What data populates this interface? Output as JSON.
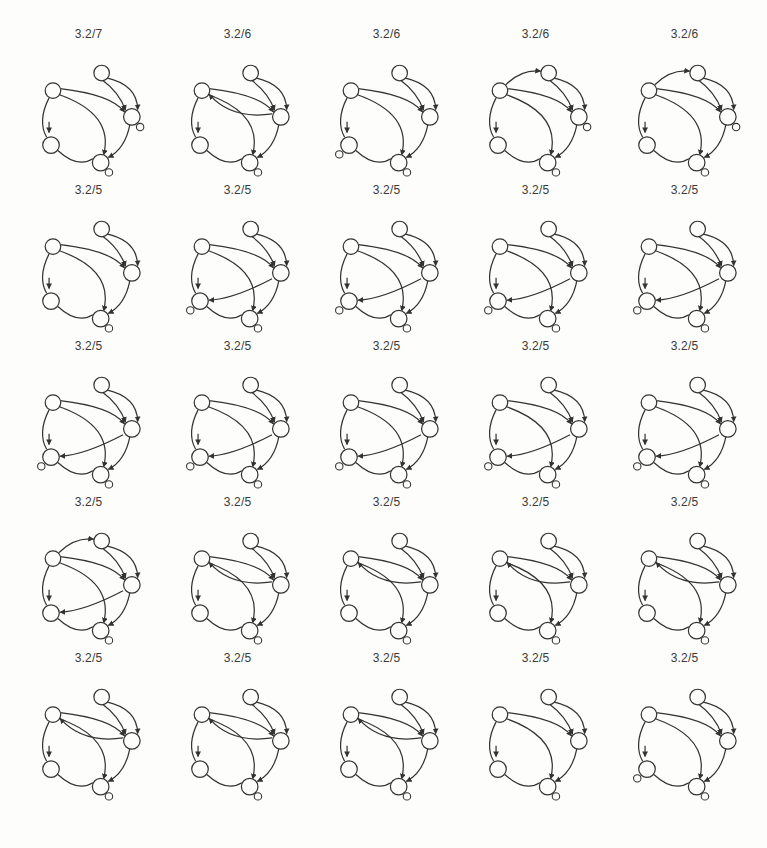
{
  "figure": {
    "background": "#fdfdfc",
    "stroke_color": "#333333",
    "node_fill": "#fdfdfc",
    "label_color": "#3a3a3a",
    "grid": {
      "rows": 5,
      "cols": 5
    }
  },
  "diagram_library": {
    "nodes": {
      "A": {
        "x": 40,
        "y": 46,
        "r": 8
      },
      "B": {
        "x": 90,
        "y": 28,
        "r": 8
      },
      "C": {
        "x": 121,
        "y": 73,
        "r": 8.5
      },
      "D": {
        "x": 38,
        "y": 102,
        "r": 8.5
      },
      "E": {
        "x": 89,
        "y": 120,
        "r": 8.5
      }
    },
    "satellites": {
      "C": {
        "x": 129.5,
        "y": 83.5,
        "r": 3.8
      },
      "D": {
        "x": 28,
        "y": 111.5,
        "r": 3.8
      },
      "E": {
        "x": 97.5,
        "y": 130,
        "r": 3.8
      }
    },
    "edges": {
      "top": {
        "d": "M 47.5 44 Q 100 50 113.5 68",
        "arrow": true
      },
      "dbl_out": {
        "d": "M 95 33 Q 126.5 40 127 65.5",
        "arrow": true
      },
      "dbl_in": {
        "d": "M 91 35.5 Q 108 48 114.5 66",
        "arrow": true
      },
      "diag": {
        "d": "M 46 50 Q 103 70 92 112",
        "arrow": true
      },
      "left": {
        "d": "M 36 53.5 Q 24 77 33.5 94",
        "arrow": false
      },
      "bottom": {
        "d": "M 45 107.5 Q 65 126 81 116",
        "arrow": false
      },
      "right": {
        "d": "M 119 81 Q 114 106 97 114.5",
        "arrow": true
      },
      "ret_d": {
        "d": "M 112 79 Q 72 100 47.5 101",
        "arrow": true
      },
      "ret_a": {
        "d": "M 112 70 Q 70 76 47.5 50",
        "arrow": true
      },
      "ab": {
        "d": "M 46 40 Q 62 24 81.5 26",
        "arrow": true
      }
    },
    "input_arrow": {
      "d": "M 36 78 L 36 89",
      "arrow": true
    },
    "variants": {
      "base": [
        "top",
        "dbl_out",
        "dbl_in",
        "diag",
        "left",
        "bottom",
        "right"
      ],
      "ret_a": [
        "top",
        "dbl_out",
        "dbl_in",
        "diag",
        "left",
        "bottom",
        "right",
        "ret_a"
      ],
      "ret_d": [
        "top",
        "dbl_out",
        "dbl_in",
        "diag",
        "left",
        "bottom",
        "right",
        "ret_d"
      ],
      "ab": [
        "top",
        "dbl_out",
        "dbl_in",
        "diag",
        "left",
        "bottom",
        "right",
        "ab"
      ],
      "ab_ret_d": [
        "top",
        "dbl_out",
        "dbl_in",
        "diag",
        "left",
        "bottom",
        "right",
        "ab",
        "ret_d"
      ]
    }
  },
  "cells": [
    {
      "label": "3.2/7",
      "variant": "base",
      "satellites": [
        "C",
        "E"
      ]
    },
    {
      "label": "3.2/6",
      "variant": "ret_a",
      "satellites": [
        "E"
      ]
    },
    {
      "label": "3.2/6",
      "variant": "base",
      "satellites": [
        "D",
        "E"
      ]
    },
    {
      "label": "3.2/6",
      "variant": "ab",
      "satellites": [
        "C",
        "E"
      ]
    },
    {
      "label": "3.2/6",
      "variant": "ab",
      "satellites": [
        "C",
        "E"
      ]
    },
    {
      "label": "3.2/5",
      "variant": "base",
      "satellites": [
        "E"
      ]
    },
    {
      "label": "3.2/5",
      "variant": "ret_d",
      "satellites": [
        "D",
        "E"
      ]
    },
    {
      "label": "3.2/5",
      "variant": "ret_d",
      "satellites": [
        "D",
        "E"
      ]
    },
    {
      "label": "3.2/5",
      "variant": "ret_d",
      "satellites": [
        "D",
        "E"
      ]
    },
    {
      "label": "3.2/5",
      "variant": "ret_d",
      "satellites": [
        "D",
        "E"
      ]
    },
    {
      "label": "3.2/5",
      "variant": "ret_d",
      "satellites": [
        "D",
        "E"
      ]
    },
    {
      "label": "3.2/5",
      "variant": "ret_d",
      "satellites": [
        "D",
        "E"
      ]
    },
    {
      "label": "3.2/5",
      "variant": "ret_d",
      "satellites": [
        "D",
        "E"
      ]
    },
    {
      "label": "3.2/5",
      "variant": "ret_d",
      "satellites": [
        "D",
        "E"
      ]
    },
    {
      "label": "3.2/5",
      "variant": "ret_d",
      "satellites": [
        "D",
        "E"
      ]
    },
    {
      "label": "3.2/5",
      "variant": "ab_ret_d",
      "satellites": [
        "E"
      ]
    },
    {
      "label": "3.2/5",
      "variant": "ret_a",
      "satellites": [
        "E"
      ]
    },
    {
      "label": "3.2/5",
      "variant": "ret_a",
      "satellites": [
        "E"
      ]
    },
    {
      "label": "3.2/5",
      "variant": "ret_a",
      "satellites": [
        "E"
      ]
    },
    {
      "label": "3.2/5",
      "variant": "ret_a",
      "satellites": [
        "E"
      ]
    },
    {
      "label": "3.2/5",
      "variant": "ret_a",
      "satellites": [
        "E"
      ]
    },
    {
      "label": "3.2/5",
      "variant": "ret_a",
      "satellites": [
        "E"
      ]
    },
    {
      "label": "3.2/5",
      "variant": "ret_a",
      "satellites": [
        "E"
      ]
    },
    {
      "label": "3.2/5",
      "variant": "base",
      "satellites": [
        "E"
      ]
    },
    {
      "label": "3.2/5",
      "variant": "base",
      "satellites": [
        "D",
        "E"
      ]
    }
  ]
}
